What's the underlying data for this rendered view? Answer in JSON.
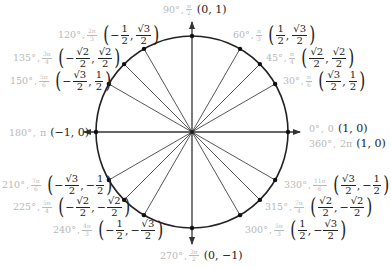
{
  "colors": {
    "angle_text": "#b8b8b8",
    "coord_text": "#222222",
    "lines": "#333333"
  },
  "points": [
    {
      "key": "p0",
      "degrees": "0°",
      "radians_text": "0",
      "radians_num": "",
      "radians_den": "",
      "x": "1",
      "y": "0"
    },
    {
      "key": "p30",
      "degrees": "30°",
      "radians_num": "π",
      "radians_den": "6",
      "x_num": "√3",
      "x_den": "2",
      "y_num": "1",
      "y_den": "2"
    },
    {
      "key": "p45",
      "degrees": "45°",
      "radians_num": "π",
      "radians_den": "4",
      "x_num": "√2",
      "x_den": "2",
      "y_num": "√2",
      "y_den": "2"
    },
    {
      "key": "p60",
      "degrees": "60°",
      "radians_num": "π",
      "radians_den": "3",
      "x_num": "1",
      "x_den": "2",
      "y_num": "√3",
      "y_den": "2"
    },
    {
      "key": "p90",
      "degrees": "90°",
      "radians_num": "π",
      "radians_den": "2",
      "x": "0",
      "y": "1"
    },
    {
      "key": "p120",
      "degrees": "120°",
      "radians_num": "2π",
      "radians_den": "3",
      "x_num": "1",
      "x_den": "2",
      "x_sign": "−",
      "y_num": "√3",
      "y_den": "2"
    },
    {
      "key": "p135",
      "degrees": "135°",
      "radians_num": "3π",
      "radians_den": "4",
      "x_num": "√2",
      "x_den": "2",
      "x_sign": "−",
      "y_num": "√2",
      "y_den": "2"
    },
    {
      "key": "p150",
      "degrees": "150°",
      "radians_num": "5π",
      "radians_den": "6",
      "x_num": "√3",
      "x_den": "2",
      "x_sign": "−",
      "y_num": "1",
      "y_den": "2"
    },
    {
      "key": "p180",
      "degrees": "180°",
      "radians_text": "π",
      "x": "−1",
      "y": "0"
    },
    {
      "key": "p210",
      "degrees": "210°",
      "radians_num": "7π",
      "radians_den": "6",
      "x_num": "√3",
      "x_den": "2",
      "x_sign": "−",
      "y_num": "1",
      "y_den": "2",
      "y_sign": "−"
    },
    {
      "key": "p225",
      "degrees": "225°",
      "radians_num": "5π",
      "radians_den": "4",
      "x_num": "√2",
      "x_den": "2",
      "x_sign": "−",
      "y_num": "√2",
      "y_den": "2",
      "y_sign": "−"
    },
    {
      "key": "p240",
      "degrees": "240°",
      "radians_num": "4π",
      "radians_den": "3",
      "x_num": "1",
      "x_den": "2",
      "x_sign": "−",
      "y_num": "√3",
      "y_den": "2",
      "y_sign": "−"
    },
    {
      "key": "p270",
      "degrees": "270°",
      "radians_num": "3π",
      "radians_den": "2",
      "x": "0",
      "y": "−1"
    },
    {
      "key": "p300",
      "degrees": "300°",
      "radians_num": "5π",
      "radians_den": "3",
      "x_num": "1",
      "x_den": "2",
      "y_num": "√3",
      "y_den": "2",
      "y_sign": "−"
    },
    {
      "key": "p315",
      "degrees": "315°",
      "radians_num": "7π",
      "radians_den": "4",
      "x_num": "√2",
      "x_den": "2",
      "y_num": "√2",
      "y_den": "2",
      "y_sign": "−"
    },
    {
      "key": "p330",
      "degrees": "330°",
      "radians_num": "11π",
      "radians_den": "6",
      "x_num": "√3",
      "x_den": "2",
      "y_num": "1",
      "y_den": "2",
      "y_sign": "−"
    },
    {
      "key": "p360",
      "degrees": "360°",
      "radians_text": "2π",
      "x": "1",
      "y": "0"
    }
  ],
  "angles_deg": [
    0,
    30,
    45,
    60,
    90,
    120,
    135,
    150,
    180,
    210,
    225,
    240,
    270,
    300,
    315,
    330
  ]
}
